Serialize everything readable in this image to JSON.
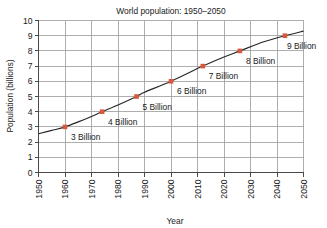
{
  "chart_data": {
    "type": "line",
    "title": "World population: 1950–2050",
    "xlabel": "Year",
    "ylabel": "Population (billions)",
    "xlim": [
      1950,
      2050
    ],
    "ylim": [
      0,
      10
    ],
    "grid": true,
    "legend": "none",
    "x_ticks": [
      1950,
      1960,
      1970,
      1980,
      1990,
      2000,
      2010,
      2020,
      2030,
      2040,
      2050
    ],
    "x_tick_labels": [
      "1950",
      "1960",
      "1970",
      "1980",
      "1990",
      "2000",
      "2010",
      "2020",
      "2030",
      "2040",
      "2050"
    ],
    "y_ticks": [
      0,
      1,
      2,
      3,
      4,
      5,
      6,
      7,
      8,
      9,
      10
    ],
    "y_tick_labels": [
      "0",
      "1",
      "2",
      "3",
      "4",
      "5",
      "6",
      "7",
      "8",
      "9",
      "10"
    ],
    "series": [
      {
        "name": "World population",
        "color": "#262626",
        "x": [
          1950,
          1955,
          1960,
          1965,
          1970,
          1974,
          1980,
          1987,
          1990,
          2000,
          2012,
          2020,
          2026,
          2035,
          2043,
          2050
        ],
        "y": [
          2.55,
          2.77,
          3.0,
          3.33,
          3.69,
          4.0,
          4.44,
          5.0,
          5.28,
          6.0,
          7.0,
          7.6,
          8.0,
          8.6,
          9.0,
          9.3
        ]
      }
    ],
    "annotated_points": [
      {
        "label": "3 Billion",
        "x": 1960,
        "y": 3,
        "marker_color": "#d9573c",
        "label_dx": 6,
        "label_dy": 13
      },
      {
        "label": "4 Billion",
        "x": 1974,
        "y": 4,
        "marker_color": "#d9573c",
        "label_dx": 6,
        "label_dy": 13
      },
      {
        "label": "5 Billion",
        "x": 1987,
        "y": 5,
        "marker_color": "#d9573c",
        "label_dx": 6,
        "label_dy": 13
      },
      {
        "label": "6 Billion",
        "x": 2000,
        "y": 6,
        "marker_color": "#d9573c",
        "label_dx": 6,
        "label_dy": 13
      },
      {
        "label": "7 Billion",
        "x": 2012,
        "y": 7,
        "marker_color": "#d9573c",
        "label_dx": 6,
        "label_dy": 13
      },
      {
        "label": "8 Billion",
        "x": 2026,
        "y": 8,
        "marker_color": "#d9573c",
        "label_dx": 6,
        "label_dy": 13
      },
      {
        "label": "9 Billion",
        "x": 2043,
        "y": 9,
        "marker_color": "#d9573c",
        "label_dx": 2,
        "label_dy": 13
      }
    ],
    "colors": {
      "marker": "#d9573c",
      "line": "#262626",
      "grid": "#9a9a9a",
      "axis": "#4a4a4a",
      "text": "#1a1a1a",
      "background": "#ffffff"
    }
  }
}
